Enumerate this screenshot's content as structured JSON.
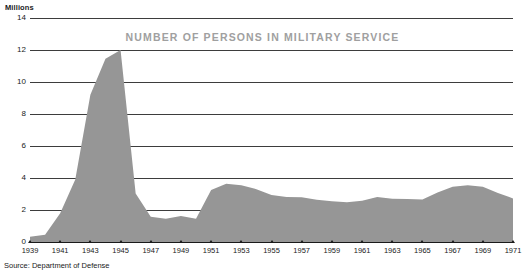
{
  "axis_unit_label": "Millions",
  "source_note": "Source: Department of Defense",
  "colors": {
    "area_fill": "#969696",
    "title_text": "#a0a0a0",
    "gridline": "#3d3d3d",
    "baseline": "#1a1a1a",
    "text": "#1a1a1a",
    "background": "#ffffff"
  },
  "chart_data": {
    "type": "area",
    "title": "NUMBER OF PERSONS IN MILITARY SERVICE",
    "subtitle": "",
    "xlabel": "",
    "ylabel": "Millions",
    "ylim": [
      0,
      14
    ],
    "xlim": [
      1939,
      1971
    ],
    "ytick_labels": [
      "0",
      "2",
      "4",
      "6",
      "8",
      "10",
      "12",
      "14"
    ],
    "ytick_values": [
      0,
      2,
      4,
      6,
      8,
      10,
      12,
      14
    ],
    "xtick_labels": [
      "1939",
      "1941",
      "1943",
      "1945",
      "1947",
      "1949",
      "1951",
      "1953",
      "1955",
      "1957",
      "1959",
      "1961",
      "1963",
      "1965",
      "1967",
      "1969",
      "1971"
    ],
    "xtick_values": [
      1939,
      1941,
      1943,
      1945,
      1947,
      1949,
      1951,
      1953,
      1955,
      1957,
      1959,
      1961,
      1963,
      1965,
      1967,
      1969,
      1971
    ],
    "grid": true,
    "legend": "none",
    "series": [
      {
        "name": "Persons in military service",
        "x": [
          1939,
          1940,
          1941,
          1942,
          1943,
          1944,
          1945,
          1946,
          1947,
          1948,
          1949,
          1950,
          1951,
          1952,
          1953,
          1954,
          1955,
          1956,
          1957,
          1958,
          1959,
          1960,
          1961,
          1962,
          1963,
          1964,
          1965,
          1966,
          1967,
          1968,
          1969,
          1970,
          1971
        ],
        "values": [
          0.33,
          0.46,
          1.8,
          3.9,
          9.2,
          11.45,
          12.0,
          3.03,
          1.58,
          1.45,
          1.62,
          1.46,
          3.25,
          3.64,
          3.55,
          3.3,
          2.94,
          2.81,
          2.8,
          2.64,
          2.55,
          2.48,
          2.58,
          2.81,
          2.7,
          2.69,
          2.66,
          3.09,
          3.45,
          3.55,
          3.46,
          3.07,
          2.72
        ]
      }
    ],
    "annotations": []
  }
}
